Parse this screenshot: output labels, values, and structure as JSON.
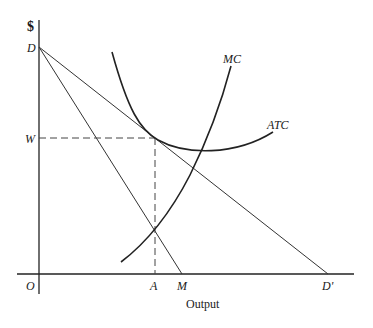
{
  "diagram": {
    "y_axis_label": "$",
    "x_axis_label": "Output",
    "origin_label": "O",
    "points": {
      "D": "D",
      "W": "W",
      "A": "A",
      "M": "M",
      "D_prime": "D'"
    },
    "curves": {
      "MC": "MC",
      "ATC": "ATC"
    },
    "lines": [
      {
        "name": "demand",
        "from": "D",
        "to": "D'"
      },
      {
        "name": "marginal-revenue",
        "from": "D",
        "to": "M"
      },
      {
        "name": "price-guide",
        "from": "W",
        "to": "tangency",
        "style": "dashed"
      },
      {
        "name": "quantity-guide",
        "from": "A",
        "to": "tangency",
        "style": "dashed"
      }
    ]
  }
}
